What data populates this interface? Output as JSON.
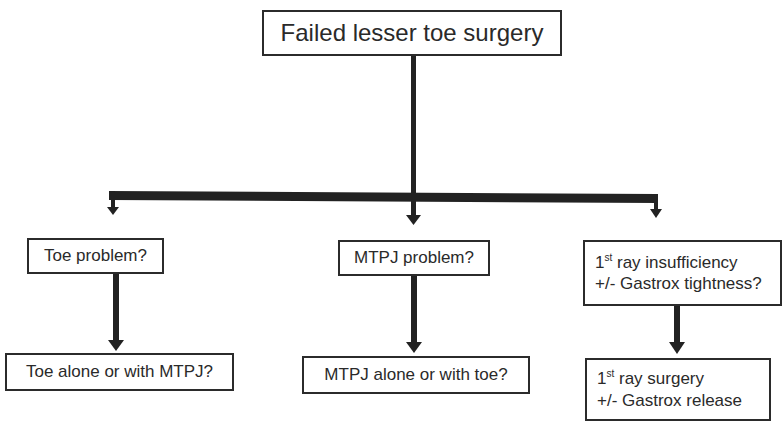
{
  "diagram": {
    "type": "flowchart",
    "root": {
      "label": "Failed lesser toe surgery"
    },
    "branches": [
      {
        "id": "toe",
        "question": {
          "lines": [
            {
              "text": "Toe problem?"
            }
          ]
        },
        "outcome": {
          "lines": [
            {
              "text": "Toe alone or with MTPJ?"
            }
          ]
        }
      },
      {
        "id": "mtpj",
        "question": {
          "lines": [
            {
              "text": "MTPJ problem?"
            }
          ]
        },
        "outcome": {
          "lines": [
            {
              "text": "MTPJ alone or with toe?"
            }
          ]
        }
      },
      {
        "id": "first-ray",
        "question": {
          "lines": [
            {
              "prefix": "1",
              "sup": "st",
              "text": " ray insufficiency"
            },
            {
              "text": "+/- Gastrox tightness?"
            }
          ]
        },
        "outcome": {
          "lines": [
            {
              "prefix": "1",
              "sup": "st",
              "text": " ray surgery"
            },
            {
              "text": "+/- Gastrox release"
            }
          ]
        }
      }
    ],
    "colors": {
      "stroke": "#222222",
      "text": "#2a2a2a",
      "background": "#ffffff"
    }
  }
}
